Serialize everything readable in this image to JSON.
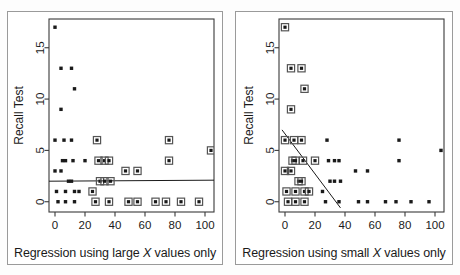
{
  "figure": {
    "panels": [
      {
        "id": "left",
        "caption_prefix": "Regression using ",
        "caption_italic": "X",
        "caption_suffix": " values only",
        "caption_word": "large",
        "caption_full": "Regression using large X values only",
        "ylabel": "Recall Test",
        "xticks": [
          "0",
          "20",
          "40",
          "60",
          "80",
          "100"
        ],
        "yticks": [
          "0",
          "5",
          "10",
          "15"
        ]
      },
      {
        "id": "right",
        "caption_prefix": "Regression using ",
        "caption_italic": "X",
        "caption_suffix": " values only",
        "caption_word": "small",
        "caption_full": "Regression using small X values only",
        "ylabel": "Recall Test",
        "xticks": [
          "0",
          "20",
          "40",
          "60",
          "80",
          "100"
        ],
        "yticks": [
          "0",
          "5",
          "10",
          "15"
        ]
      }
    ],
    "colors": {
      "marker": "#1a1a1a",
      "highlight_box": "#555555",
      "regression_line": "#1a1a1a",
      "axis": "#3a3a3a",
      "panel_border": "#9a9a9a",
      "background": "#ffffff"
    }
  },
  "chart_data": [
    {
      "type": "scatter",
      "title": "Regression using large X values only",
      "xlabel": "Regression using large X values only",
      "ylabel": "Recall Test",
      "xlim": [
        -4,
        106
      ],
      "ylim": [
        -1,
        17.8
      ],
      "xticks": [
        0,
        20,
        40,
        60,
        80,
        100
      ],
      "yticks": [
        0,
        5,
        10,
        15
      ],
      "grid": false,
      "legend": null,
      "marker_styles": {
        "plain": "small filled square",
        "highlighted": "filled square with open square outline ring"
      },
      "highlight_rule": "large X values (x >= 25) are boxed and used for the regression fit",
      "points": [
        {
          "x": 0,
          "y": 17,
          "highlighted": false
        },
        {
          "x": 4,
          "y": 13,
          "highlighted": false
        },
        {
          "x": 11,
          "y": 13,
          "highlighted": false
        },
        {
          "x": 13,
          "y": 11,
          "highlighted": false
        },
        {
          "x": 4,
          "y": 9,
          "highlighted": false
        },
        {
          "x": 0,
          "y": 6,
          "highlighted": false
        },
        {
          "x": 6,
          "y": 6,
          "highlighted": false
        },
        {
          "x": 11,
          "y": 6,
          "highlighted": false
        },
        {
          "x": 28,
          "y": 6,
          "highlighted": true
        },
        {
          "x": 76,
          "y": 6,
          "highlighted": true
        },
        {
          "x": 104,
          "y": 5,
          "highlighted": true
        },
        {
          "x": 5,
          "y": 4,
          "highlighted": false
        },
        {
          "x": 7,
          "y": 4,
          "highlighted": false
        },
        {
          "x": 12,
          "y": 4,
          "highlighted": false
        },
        {
          "x": 20,
          "y": 4,
          "highlighted": false
        },
        {
          "x": 29,
          "y": 4,
          "highlighted": true
        },
        {
          "x": 33,
          "y": 4,
          "highlighted": true
        },
        {
          "x": 36,
          "y": 4,
          "highlighted": true
        },
        {
          "x": 76,
          "y": 4,
          "highlighted": true
        },
        {
          "x": 0,
          "y": 3,
          "highlighted": false
        },
        {
          "x": 4,
          "y": 3,
          "highlighted": false
        },
        {
          "x": 47,
          "y": 3,
          "highlighted": true
        },
        {
          "x": 55,
          "y": 3,
          "highlighted": true
        },
        {
          "x": 9,
          "y": 2,
          "highlighted": false
        },
        {
          "x": 11,
          "y": 2,
          "highlighted": false
        },
        {
          "x": 30,
          "y": 2,
          "highlighted": true
        },
        {
          "x": 33,
          "y": 2,
          "highlighted": true
        },
        {
          "x": 37,
          "y": 2,
          "highlighted": true
        },
        {
          "x": 1,
          "y": 1,
          "highlighted": false
        },
        {
          "x": 7,
          "y": 1,
          "highlighted": false
        },
        {
          "x": 13,
          "y": 1,
          "highlighted": false
        },
        {
          "x": 16,
          "y": 1,
          "highlighted": false
        },
        {
          "x": 25,
          "y": 1,
          "highlighted": true
        },
        {
          "x": 2,
          "y": 0,
          "highlighted": false
        },
        {
          "x": 7,
          "y": 0,
          "highlighted": false
        },
        {
          "x": 13,
          "y": 0,
          "highlighted": false
        },
        {
          "x": 27,
          "y": 0,
          "highlighted": true
        },
        {
          "x": 36,
          "y": 0,
          "highlighted": true
        },
        {
          "x": 49,
          "y": 0,
          "highlighted": true
        },
        {
          "x": 55,
          "y": 0,
          "highlighted": true
        },
        {
          "x": 67,
          "y": 0,
          "highlighted": true
        },
        {
          "x": 74,
          "y": 0,
          "highlighted": true
        },
        {
          "x": 84,
          "y": 0,
          "highlighted": true
        },
        {
          "x": 96,
          "y": 0,
          "highlighted": true
        }
      ],
      "regression_line": {
        "x_start": -4,
        "y_start": 2.0,
        "x_end": 106,
        "y_end": 2.1,
        "slope": 0.001,
        "intercept": 2.0,
        "description": "nearly flat line at Recall Test = 2"
      }
    },
    {
      "type": "scatter",
      "title": "Regression using small X values only",
      "xlabel": "Regression using small X values only",
      "ylabel": "Recall Test",
      "xlim": [
        -4,
        106
      ],
      "ylim": [
        -1,
        17.8
      ],
      "xticks": [
        0,
        20,
        40,
        60,
        80,
        100
      ],
      "yticks": [
        0,
        5,
        10,
        15
      ],
      "grid": false,
      "legend": null,
      "marker_styles": {
        "plain": "small filled square",
        "highlighted": "filled square with open square outline ring"
      },
      "highlight_rule": "small X values (x <= 20) are boxed and used for the regression fit",
      "points": [
        {
          "x": 0,
          "y": 17,
          "highlighted": true
        },
        {
          "x": 4,
          "y": 13,
          "highlighted": true
        },
        {
          "x": 11,
          "y": 13,
          "highlighted": true
        },
        {
          "x": 13,
          "y": 11,
          "highlighted": true
        },
        {
          "x": 4,
          "y": 9,
          "highlighted": true
        },
        {
          "x": 0,
          "y": 6,
          "highlighted": true
        },
        {
          "x": 6,
          "y": 6,
          "highlighted": true
        },
        {
          "x": 11,
          "y": 6,
          "highlighted": true
        },
        {
          "x": 28,
          "y": 6,
          "highlighted": false
        },
        {
          "x": 76,
          "y": 6,
          "highlighted": false
        },
        {
          "x": 104,
          "y": 5,
          "highlighted": false
        },
        {
          "x": 5,
          "y": 4,
          "highlighted": true
        },
        {
          "x": 7,
          "y": 4,
          "highlighted": true
        },
        {
          "x": 12,
          "y": 4,
          "highlighted": true
        },
        {
          "x": 20,
          "y": 4,
          "highlighted": true
        },
        {
          "x": 29,
          "y": 4,
          "highlighted": false
        },
        {
          "x": 33,
          "y": 4,
          "highlighted": false
        },
        {
          "x": 36,
          "y": 4,
          "highlighted": false
        },
        {
          "x": 76,
          "y": 4,
          "highlighted": false
        },
        {
          "x": 0,
          "y": 3,
          "highlighted": true
        },
        {
          "x": 4,
          "y": 3,
          "highlighted": true
        },
        {
          "x": 47,
          "y": 3,
          "highlighted": false
        },
        {
          "x": 55,
          "y": 3,
          "highlighted": false
        },
        {
          "x": 9,
          "y": 2,
          "highlighted": true
        },
        {
          "x": 11,
          "y": 2,
          "highlighted": true
        },
        {
          "x": 30,
          "y": 2,
          "highlighted": false
        },
        {
          "x": 33,
          "y": 2,
          "highlighted": false
        },
        {
          "x": 37,
          "y": 2,
          "highlighted": false
        },
        {
          "x": 1,
          "y": 1,
          "highlighted": true
        },
        {
          "x": 7,
          "y": 1,
          "highlighted": true
        },
        {
          "x": 13,
          "y": 1,
          "highlighted": true
        },
        {
          "x": 16,
          "y": 1,
          "highlighted": true
        },
        {
          "x": 25,
          "y": 1,
          "highlighted": false
        },
        {
          "x": 2,
          "y": 0,
          "highlighted": true
        },
        {
          "x": 7,
          "y": 0,
          "highlighted": true
        },
        {
          "x": 13,
          "y": 0,
          "highlighted": true
        },
        {
          "x": 27,
          "y": 0,
          "highlighted": false
        },
        {
          "x": 36,
          "y": 0,
          "highlighted": false
        },
        {
          "x": 49,
          "y": 0,
          "highlighted": false
        },
        {
          "x": 55,
          "y": 0,
          "highlighted": false
        },
        {
          "x": 67,
          "y": 0,
          "highlighted": false
        },
        {
          "x": 74,
          "y": 0,
          "highlighted": false
        },
        {
          "x": 84,
          "y": 0,
          "highlighted": false
        },
        {
          "x": 96,
          "y": 0,
          "highlighted": false
        }
      ],
      "regression_line": {
        "x_start": -2,
        "y_start": 7.0,
        "x_end": 37,
        "y_end": -0.6,
        "slope": -0.195,
        "intercept": 6.6,
        "description": "steep downward sloping line from about (-2, 7) to (37, -0.6)"
      }
    }
  ]
}
